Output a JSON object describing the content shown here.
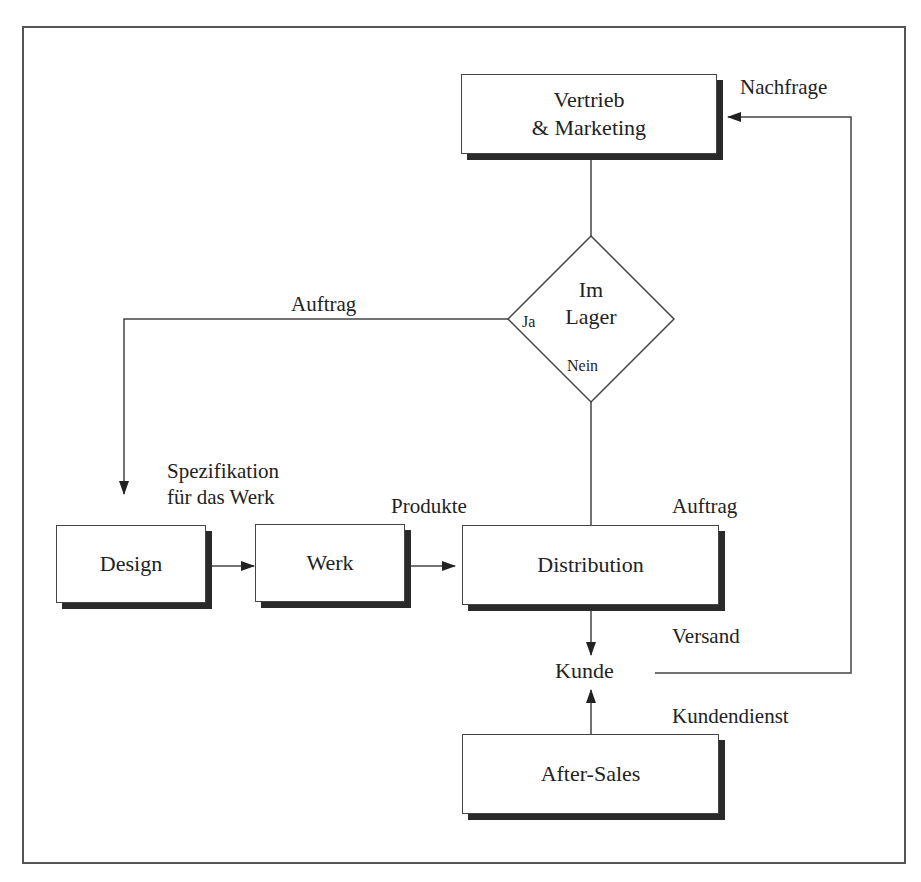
{
  "diagram": {
    "nodes": {
      "vertrieb": {
        "line1": "Vertrieb",
        "line2": "& Marketing"
      },
      "decision": {
        "line1": "Im",
        "line2": "Lager",
        "yes": "Ja",
        "no": "Nein"
      },
      "design": "Design",
      "werk": "Werk",
      "distribution": "Distribution",
      "kunde": "Kunde",
      "after_sales": "After-Sales"
    },
    "edge_labels": {
      "nachfrage": "Nachfrage",
      "auftrag_left": "Auftrag",
      "spezifikation_line1": "Spezifikation",
      "spezifikation_line2": "für das Werk",
      "produkte": "Produkte",
      "auftrag_right": "Auftrag",
      "versand": "Versand",
      "kundendienst": "Kundendienst"
    },
    "colors": {
      "line": "#444444",
      "shadow": "#2a2a2a",
      "background": "#ffffff"
    }
  }
}
